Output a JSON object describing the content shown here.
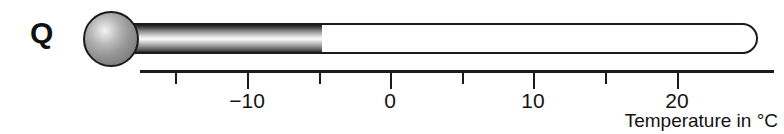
{
  "figure": {
    "panel_letter": "Q",
    "width": 784,
    "height": 134
  },
  "thermometer": {
    "reading_value": -5,
    "reading_unit": "°C",
    "bulb": {
      "cx": 111,
      "cy": 39,
      "r": 28
    },
    "tube": {
      "x": 108,
      "y": 23,
      "width": 650,
      "height": 31
    },
    "fill": {
      "x": 110,
      "y": 25,
      "width": 212,
      "height": 27
    },
    "colors": {
      "outline": "#1b1b1b",
      "tube_background": "#ffffff",
      "mercury_light": "#fbfbfb",
      "mercury_dark": "#1d1d1d",
      "bulb_highlight": "#f4f4f4",
      "bulb_shade": "#6e6e6e"
    }
  },
  "axis": {
    "caption": "Temperature in °C",
    "line": {
      "x": 140,
      "y": 70,
      "width": 634
    },
    "color": "#1b1b1b",
    "pixels_per_degree": 14.3,
    "ticks": [
      {
        "value": -15,
        "x": 175,
        "type": "minor",
        "label": ""
      },
      {
        "value": -10,
        "x": 247,
        "type": "major",
        "label": "−10"
      },
      {
        "value": -5,
        "x": 319,
        "type": "minor",
        "label": ""
      },
      {
        "value": 0,
        "x": 390,
        "type": "major",
        "label": "0"
      },
      {
        "value": 5,
        "x": 462,
        "type": "minor",
        "label": ""
      },
      {
        "value": 10,
        "x": 533,
        "type": "major",
        "label": "10"
      },
      {
        "value": 15,
        "x": 605,
        "type": "minor",
        "label": ""
      },
      {
        "value": 20,
        "x": 677,
        "type": "major",
        "label": "20"
      }
    ]
  },
  "chart_data": {
    "type": "bar",
    "title": "Q",
    "xlabel": "Temperature in °C",
    "ylabel": "",
    "categories": [
      "Q"
    ],
    "values": [
      -5
    ],
    "xlim": [
      -17.5,
      24.3
    ],
    "xticks": [
      -15,
      -10,
      -5,
      0,
      5,
      10,
      15,
      20
    ],
    "xticklabels": [
      "",
      "−10",
      "",
      "0",
      "",
      "10",
      "",
      "20"
    ],
    "grid": false,
    "legend": null,
    "annotations": [
      "Thermometer reading approximately −5 °C"
    ]
  }
}
